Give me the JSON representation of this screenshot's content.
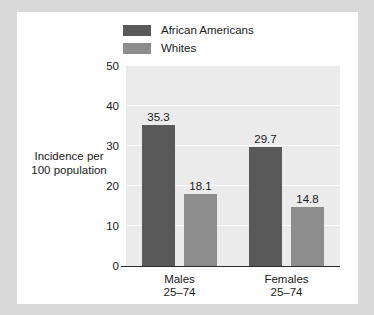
{
  "chart_data": {
    "type": "bar",
    "title": "",
    "xlabel": "",
    "ylabel": "Incidence per\n100 population",
    "ylabel_line1": "Incidence per",
    "ylabel_line2": "100 population",
    "ylim": [
      0,
      50
    ],
    "yticks": [
      0,
      10,
      20,
      30,
      40,
      50
    ],
    "ytick_labels": [
      "0",
      "10",
      "20",
      "30",
      "40",
      "50"
    ],
    "grid": true,
    "legend_position": "top-center",
    "categories": [
      "Males 25–74",
      "Females 25–74"
    ],
    "category_labels": [
      {
        "line1": "Males",
        "line2": "25–74"
      },
      {
        "line1": "Females",
        "line2": "25–74"
      }
    ],
    "series": [
      {
        "name": "African Americans",
        "color": "#595959",
        "values": [
          35.3,
          29.7
        ],
        "value_labels": [
          "35.3",
          "29.7"
        ]
      },
      {
        "name": "Whites",
        "color": "#8d8d8d",
        "values": [
          18.1,
          14.8
        ],
        "value_labels": [
          "18.1",
          "14.8"
        ]
      }
    ]
  },
  "legend": {
    "items": [
      {
        "label": "African Americans",
        "color": "#595959"
      },
      {
        "label": "Whites",
        "color": "#8d8d8d"
      }
    ]
  },
  "colors": {
    "page_background": "#d9d9d9",
    "card_background": "#ffffff",
    "plot_background": "#ebebeb",
    "gridline": "#fbfbfb",
    "axis_line": "#2b2b2b",
    "text": "#1a1a1a",
    "series_dark": "#595959",
    "series_light": "#8d8d8d"
  }
}
